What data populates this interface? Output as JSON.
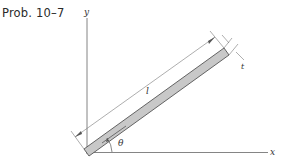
{
  "figure": {
    "problem_label": "Prob. 10–7",
    "axes": {
      "x_label": "x",
      "y_label": "y"
    },
    "bar": {
      "length_label": "l",
      "thickness_label": "t",
      "angle_label": "θ",
      "fill_color": "#c8c8c8",
      "stroke_color": "#555555"
    }
  }
}
